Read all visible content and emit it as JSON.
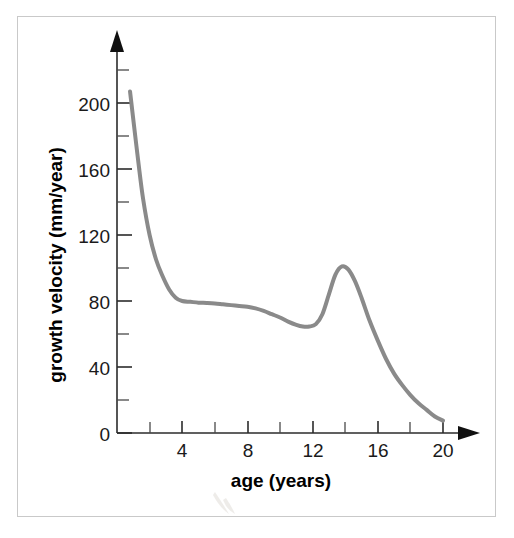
{
  "figure": {
    "background_color": "#ffffff",
    "frame_color": "#c9c9c9",
    "curve_color": "#8a8a8a",
    "axis_color": "#2b2b2b",
    "text_color": "#1a1a1a"
  },
  "chart_data": {
    "type": "line",
    "title": "",
    "subtitle": "",
    "xlabel": "age (years)",
    "ylabel": "growth velocity (mm/year)",
    "xlim": [
      0,
      21.5
    ],
    "ylim": [
      0,
      220
    ],
    "grid": false,
    "legend": null,
    "x_ticks_major": [
      4,
      8,
      12,
      16,
      20
    ],
    "x_tick_labels": [
      "4",
      "8",
      "12",
      "16",
      "20"
    ],
    "x_ticks_all": [
      2,
      4,
      6,
      8,
      10,
      12,
      14,
      16,
      18,
      20
    ],
    "y_ticks_major": [
      0,
      40,
      80,
      120,
      160,
      200
    ],
    "y_tick_labels": [
      "0",
      "40",
      "80",
      "120",
      "160",
      "200"
    ],
    "y_ticks_minor": [
      20,
      60,
      100,
      140,
      180,
      220
    ],
    "axis_arrows": {
      "x": true,
      "y": true
    },
    "series": [
      {
        "name": "growth velocity",
        "color": "#8a8a8a",
        "line_width": 4,
        "x": [
          0.8,
          1.0,
          1.3,
          1.6,
          2.0,
          2.4,
          2.8,
          3.2,
          3.6,
          4.0,
          4.5,
          5.0,
          5.5,
          6.0,
          6.5,
          7.0,
          7.5,
          8.0,
          8.5,
          9.0,
          9.5,
          10.0,
          10.5,
          11.0,
          11.4,
          11.8,
          12.2,
          12.6,
          13.0,
          13.4,
          13.8,
          14.2,
          14.6,
          15.0,
          15.5,
          16.0,
          16.5,
          17.0,
          17.5,
          18.0,
          18.5,
          19.0,
          19.5,
          20.0
        ],
        "y": [
          207,
          190,
          165,
          142,
          120,
          105,
          95,
          87,
          82,
          80,
          79.5,
          79,
          78.8,
          78.5,
          78,
          77.5,
          77,
          76.5,
          75.5,
          74,
          72,
          70,
          67.5,
          65.5,
          64.5,
          64.5,
          66,
          72,
          84,
          96,
          101,
          99,
          92,
          82,
          68,
          56,
          45,
          36,
          29,
          23,
          18,
          14,
          10,
          7.5
        ]
      }
    ],
    "annotations": [
      {
        "label": "infancy rapid decline",
        "age_range": [
          0.8,
          4
        ],
        "description": "velocity falls steeply from about 207 to 80 mm/year"
      },
      {
        "label": "childhood plateau",
        "age_range": [
          4,
          11
        ],
        "description": "velocity slowly declines from 80 to about 64 mm/year"
      },
      {
        "label": "pubertal growth spurt",
        "age_range": [
          11.5,
          16
        ],
        "description": "peak velocity about 101 mm/year near age 13.8"
      },
      {
        "label": "growth cessation",
        "age_range": [
          16,
          20
        ],
        "description": "velocity falls toward about 7 mm/year by age 20"
      }
    ]
  }
}
